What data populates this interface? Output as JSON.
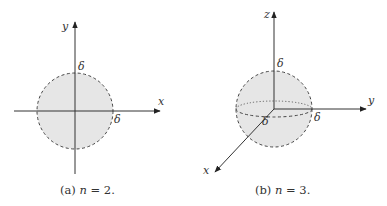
{
  "figures": [
    {
      "id": "a",
      "caption_prefix": "(a) ",
      "caption_var": "n",
      "caption_rest": " = 2.",
      "axes": {
        "x": "x",
        "y": "y"
      },
      "radius_labels": [
        "δ",
        "δ"
      ],
      "shape": "disk"
    },
    {
      "id": "b",
      "caption_prefix": "(b) ",
      "caption_var": "n",
      "caption_rest": " = 3.",
      "axes": {
        "x": "x",
        "y": "y",
        "z": "z"
      },
      "radius_labels": [
        "δ",
        "δ",
        "δ"
      ],
      "shape": "ball"
    }
  ],
  "colors": {
    "fill": "#e6e6e6",
    "stroke": "#444444",
    "axis": "#333333"
  }
}
